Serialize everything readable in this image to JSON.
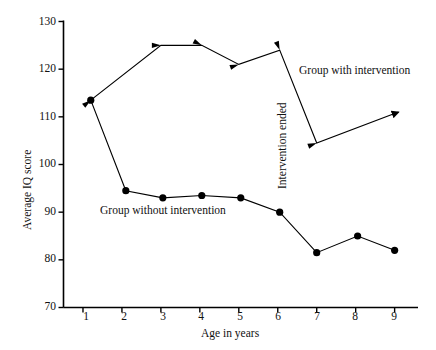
{
  "chart_data": {
    "type": "line",
    "title": "",
    "xlabel": "Age in years",
    "ylabel": "Average IQ score",
    "xlim": [
      0.5,
      9.6
    ],
    "ylim": [
      70,
      130
    ],
    "xticks": [
      1,
      2,
      3,
      4,
      5,
      6,
      7,
      8,
      9
    ],
    "yticks": [
      70,
      80,
      90,
      100,
      110,
      120,
      130
    ],
    "grid": false,
    "legend": "inline-annotations",
    "series": [
      {
        "name": "Group with intervention",
        "marker": "arrowhead",
        "x": [
          1.2,
          3.0,
          4.05,
          5.0,
          6.05,
          7.0,
          9.1
        ],
        "y": [
          113.5,
          125.0,
          125.0,
          121.0,
          124.0,
          104.5,
          111.0
        ]
      },
      {
        "name": "Group without intervention",
        "marker": "filled-circle",
        "x": [
          1.2,
          2.1,
          3.05,
          4.05,
          5.05,
          6.05,
          7.0,
          8.05,
          9.0
        ],
        "y": [
          113.5,
          94.5,
          93.0,
          93.5,
          93.0,
          90.0,
          81.5,
          85.0,
          82.0
        ]
      }
    ],
    "annotations": [
      {
        "text": "Group with intervention",
        "x": 7.0,
        "y": 117.5,
        "rotation": 0
      },
      {
        "text": "Group without intervention",
        "x": 3.3,
        "y": 89.5,
        "rotation": 0
      },
      {
        "text": "Intervention ended",
        "x": 6.25,
        "y": 105.0,
        "rotation": -90
      }
    ]
  },
  "axes": {
    "y_title": "Average IQ score",
    "x_title": "Age in years",
    "y_tick_labels": [
      "130",
      "120",
      "110",
      "100",
      "90",
      "80",
      "70"
    ],
    "x_tick_labels": [
      "1",
      "2",
      "3",
      "4",
      "5",
      "6",
      "7",
      "8",
      "9"
    ]
  },
  "annotations": {
    "group_with": "Group with intervention",
    "group_without": "Group without intervention",
    "intervention_ended": "Intervention ended"
  },
  "colors": {
    "line": "#000000",
    "marker": "#000000",
    "axis": "#000000",
    "background": "#ffffff"
  }
}
